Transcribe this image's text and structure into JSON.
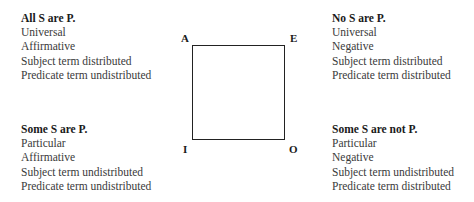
{
  "corners": {
    "A": "A",
    "E": "E",
    "I": "I",
    "O": "O"
  },
  "propositions": {
    "A": {
      "title": "All S are P.",
      "lines": [
        "Universal",
        "Affirmative",
        "Subject term distributed",
        "Predicate term undistributed"
      ]
    },
    "E": {
      "title": "No S are P.",
      "lines": [
        "Universal",
        "Negative",
        "Subject term distributed",
        "Predicate term distributed"
      ]
    },
    "I": {
      "title": "Some S are P.",
      "lines": [
        "Particular",
        "Affirmative",
        "Subject term undistributed",
        "Predicate term undistributed"
      ]
    },
    "O": {
      "title": "Some S are not P.",
      "lines": [
        "Particular",
        "Negative",
        "Subject term undistributed",
        "Predicate term distributed"
      ]
    }
  }
}
